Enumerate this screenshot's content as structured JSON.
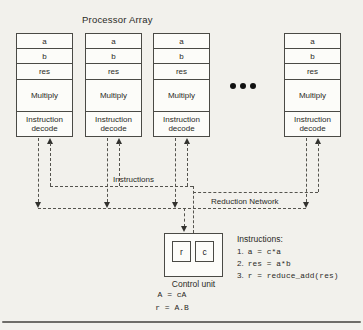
{
  "figure": {
    "title": "Processor Array",
    "processor": {
      "reg_a": "a",
      "reg_b": "b",
      "reg_res": "res",
      "alu": "Multiply",
      "decode": "Instruction decode"
    },
    "buses": {
      "instructions_label": "Instructions",
      "reduction_label": "Reduction Network"
    },
    "control_unit": {
      "reg_r": "r",
      "reg_c": "c",
      "label": "Control unit",
      "eq1": "A = cA",
      "eq2": "r = A.B"
    },
    "program": {
      "heading": "Instructions:",
      "items": [
        {
          "num": "1.",
          "code": "a = c*a"
        },
        {
          "num": "2.",
          "code": "res = a*b"
        },
        {
          "num": "3.",
          "code": "r = reduce_add(res)"
        }
      ]
    },
    "colors": {
      "background": "#f2f1ec",
      "box_line": "#4a4a45",
      "dash_line": "#55544e",
      "text": "#2a2a26"
    }
  }
}
